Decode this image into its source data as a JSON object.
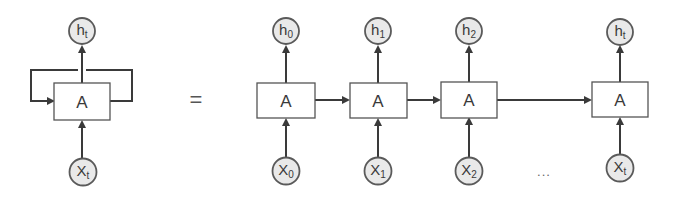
{
  "diagram": {
    "type": "rnn-unrolled",
    "colors": {
      "line": "#3a3a3a",
      "node_fill": "#e9e9e9",
      "node_stroke": "#5a5a5a",
      "box_stroke": "#555555"
    },
    "rolled": {
      "cell": {
        "label": "A",
        "cx": 82,
        "cy": 101
      },
      "output": {
        "base": "h",
        "sub": "t",
        "cx": 82,
        "cy": 31
      },
      "input": {
        "base": "X",
        "sub": "t",
        "cx": 83,
        "cy": 172
      }
    },
    "equals": {
      "symbol": "=",
      "x": 196,
      "y": 101
    },
    "unrolled": [
      {
        "cell": "A",
        "cx": 286,
        "out_base": "h",
        "out_sub": "0",
        "in_base": "X",
        "in_sub": "0"
      },
      {
        "cell": "A",
        "cx": 378,
        "out_base": "h",
        "out_sub": "1",
        "in_base": "X",
        "in_sub": "1"
      },
      {
        "cell": "A",
        "cx": 469,
        "out_base": "h",
        "out_sub": "2",
        "in_base": "X",
        "in_sub": "2"
      },
      {
        "cell": "A",
        "cx": 620,
        "out_base": "h",
        "out_sub": "t",
        "in_base": "X",
        "in_sub": "t"
      }
    ],
    "ellipsis": {
      "text": "...",
      "x": 544,
      "y": 171
    }
  }
}
